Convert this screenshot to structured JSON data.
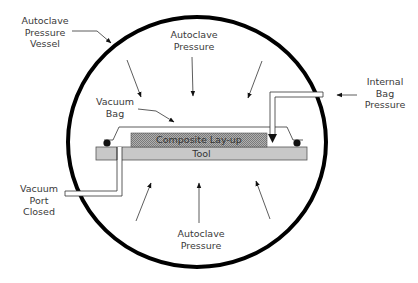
{
  "diagram": {
    "type": "autoclave vacuum bag cross-section",
    "labels": {
      "pressure_vessel": [
        "Autoclave",
        "Pressure",
        "Vessel"
      ],
      "autoclave_pressure_top": [
        "Autoclave",
        "Pressure"
      ],
      "internal_bag_pressure": [
        "Internal",
        "Bag",
        "Pressure"
      ],
      "vacuum_bag": [
        "Vacuum",
        "Bag"
      ],
      "composite_layup": "Composite Lay-up",
      "tool": "Tool",
      "vacuum_port": [
        "Vacuum",
        "Port",
        "Closed"
      ],
      "autoclave_pressure_bottom": [
        "Autoclave",
        "Pressure"
      ]
    },
    "colors": {
      "vessel_stroke": "#000000",
      "tool_fill": "#c8c8c8",
      "layup_fill": "#9a9a9a",
      "line": "#333333"
    }
  }
}
